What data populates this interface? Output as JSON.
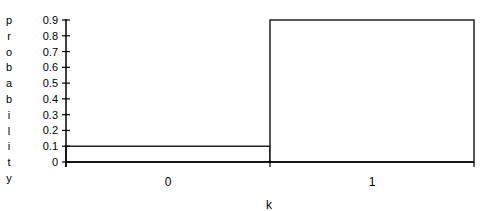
{
  "chart_data": {
    "type": "bar",
    "title": "",
    "xlabel": "k",
    "ylabel": "probability",
    "categories": [
      "0",
      "1"
    ],
    "values": [
      0.1,
      0.9
    ],
    "ylim": [
      0,
      0.9
    ],
    "yticks": [
      "0",
      "0.1",
      "0.2",
      "0.3",
      "0.4",
      "0.5",
      "0.6",
      "0.7",
      "0.8",
      "0.9"
    ],
    "grid": false,
    "legend": null
  }
}
